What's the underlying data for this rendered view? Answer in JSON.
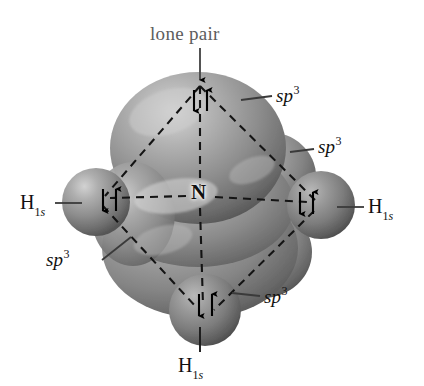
{
  "figure": {
    "background_color": "#ffffff",
    "central_atom": {
      "symbol": "N",
      "name": "nitrogen-atom-label"
    },
    "annotations": {
      "lone_pair_label": "lone pair",
      "orbital_label_base": "sp",
      "orbital_label_sup": "3",
      "hydrogen_symbol": "H",
      "hydrogen_sub_number": "1",
      "hydrogen_sub_orbital": "s"
    },
    "labels": [
      {
        "id": "lone-pair",
        "text": "lone pair",
        "kind": "callout",
        "color": "#5d5d5d",
        "x": 150,
        "y": 24
      },
      {
        "id": "sp3-top-right",
        "text": "sp3",
        "kind": "orbital",
        "color": "#111111",
        "x": 276,
        "y": 86
      },
      {
        "id": "sp3-mid-right",
        "text": "sp3",
        "kind": "orbital",
        "color": "#111111",
        "x": 318,
        "y": 137
      },
      {
        "id": "sp3-low-left",
        "text": "sp3",
        "kind": "orbital",
        "color": "#111111",
        "x": 46,
        "y": 250
      },
      {
        "id": "sp3-low-right",
        "text": "sp3",
        "kind": "orbital",
        "color": "#111111",
        "x": 264,
        "y": 287
      },
      {
        "id": "h-left",
        "text": "H1s",
        "kind": "atom",
        "color": "#111111",
        "x": 20,
        "y": 192
      },
      {
        "id": "h-right",
        "text": "H1s",
        "kind": "atom",
        "color": "#111111",
        "x": 368,
        "y": 196
      },
      {
        "id": "h-bottom",
        "text": "H1s",
        "kind": "atom",
        "color": "#111111",
        "x": 178,
        "y": 355
      },
      {
        "id": "n-center",
        "text": "N",
        "kind": "atom",
        "color": "#101010",
        "x": 191,
        "y": 182
      }
    ],
    "electron_pairs": [
      {
        "id": "lone-pair-electrons",
        "position": "top-lobe",
        "spins": "down-up",
        "x": 200,
        "y": 100
      },
      {
        "id": "bond-electrons-left",
        "position": "left-bond",
        "spins": "down-up",
        "x": 108,
        "y": 200
      },
      {
        "id": "bond-electrons-right",
        "position": "right-bond",
        "spins": "down-up",
        "x": 305,
        "y": 203
      },
      {
        "id": "bond-electrons-bottom",
        "position": "bottom-bond",
        "spins": "down-up",
        "x": 205,
        "y": 305
      }
    ],
    "geometry": {
      "shape": "tetrahedral",
      "colors": {
        "orbital_fill": "#8c8c8c",
        "orbital_highlight": "#d8d8d8",
        "orbital_shadow": "#4a4a4a",
        "hydrogen_fill": "#909090",
        "dashed_line": "#141414",
        "leader_line": "#3a3a3a",
        "arrow": "#000000"
      }
    }
  }
}
